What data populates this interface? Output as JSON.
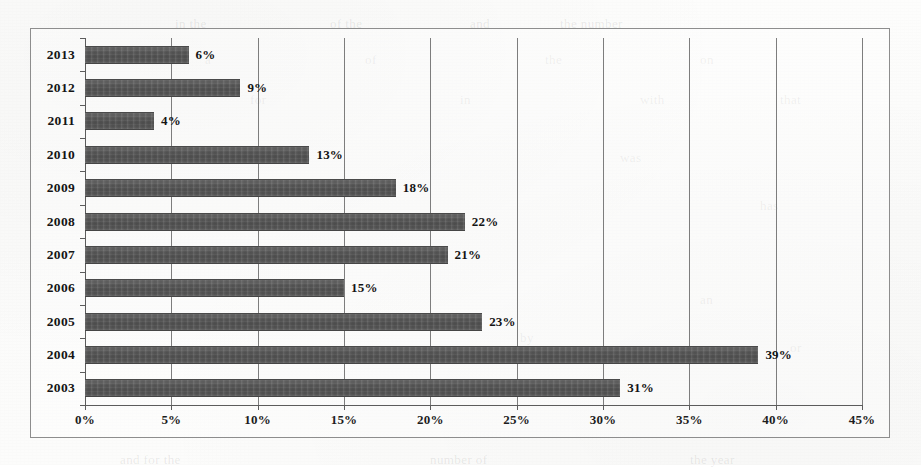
{
  "chart_data": {
    "type": "bar",
    "orientation": "horizontal",
    "title": "",
    "subtitle": "",
    "xlabel": "",
    "ylabel": "",
    "categories": [
      "2013",
      "2012",
      "2011",
      "2010",
      "2009",
      "2008",
      "2007",
      "2006",
      "2005",
      "2004",
      "2003"
    ],
    "values": [
      6,
      9,
      4,
      13,
      18,
      22,
      21,
      15,
      23,
      39,
      31
    ],
    "value_labels": [
      "6%",
      "9%",
      "4%",
      "13%",
      "18%",
      "22%",
      "21%",
      "15%",
      "23%",
      "39%",
      "31%"
    ],
    "xlim": [
      0,
      45
    ],
    "xtick_values": [
      0,
      5,
      10,
      15,
      20,
      25,
      30,
      35,
      40,
      45
    ],
    "xtick_labels": [
      "0%",
      "5%",
      "10%",
      "15%",
      "20%",
      "25%",
      "30%",
      "35%",
      "40%",
      "45%"
    ],
    "grid": "vertical",
    "legend": "none",
    "units": "percent",
    "bar_color": "#585858",
    "axis_color": "#5c5c5c",
    "grid_color": "#7d7d7d",
    "frame_color": "#8d8d8d",
    "background_color": "#fdfdfc"
  },
  "ghost_text": [
    {
      "text": "in the",
      "x": 175,
      "y": 16
    },
    {
      "text": "of the",
      "x": 330,
      "y": 16
    },
    {
      "text": "and",
      "x": 470,
      "y": 16
    },
    {
      "text": "the number",
      "x": 560,
      "y": 16
    },
    {
      "text": "a",
      "x": 205,
      "y": 52
    },
    {
      "text": "of",
      "x": 365,
      "y": 52
    },
    {
      "text": "the",
      "x": 545,
      "y": 52
    },
    {
      "text": "on",
      "x": 700,
      "y": 52
    },
    {
      "text": "for",
      "x": 250,
      "y": 92
    },
    {
      "text": "in",
      "x": 460,
      "y": 92
    },
    {
      "text": "with",
      "x": 640,
      "y": 92
    },
    {
      "text": "that",
      "x": 780,
      "y": 92
    },
    {
      "text": "to",
      "x": 300,
      "y": 150
    },
    {
      "text": "was",
      "x": 620,
      "y": 150
    },
    {
      "text": "has",
      "x": 760,
      "y": 198
    },
    {
      "text": "it",
      "x": 420,
      "y": 250
    },
    {
      "text": "an",
      "x": 700,
      "y": 292
    },
    {
      "text": "by",
      "x": 520,
      "y": 330
    },
    {
      "text": "or",
      "x": 790,
      "y": 340
    },
    {
      "text": "and for the",
      "x": 120,
      "y": 452
    },
    {
      "text": "number of",
      "x": 430,
      "y": 452
    },
    {
      "text": "the year",
      "x": 690,
      "y": 452
    }
  ]
}
